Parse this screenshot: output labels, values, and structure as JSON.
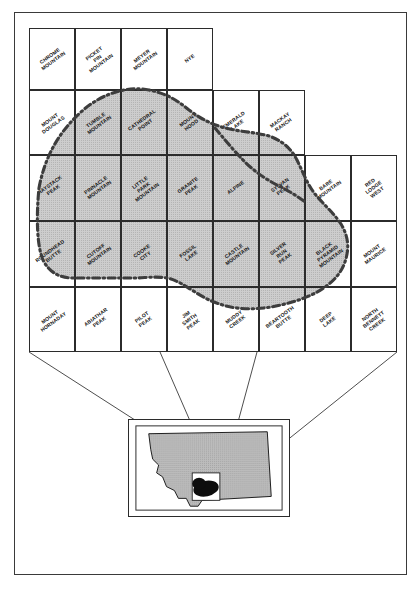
{
  "figure": {
    "kind": "index-map",
    "colors": {
      "shade_fill": "#c9c9c9",
      "boundary": "#3d3d3d",
      "line": "#2b2b2b",
      "study_area": "#101010",
      "paper": "#ffffff"
    }
  },
  "quad_grid": {
    "rows": [
      {
        "row": 1,
        "cells": [
          {
            "col": 1,
            "label": "CHROME\nMOUNTAIN"
          },
          {
            "col": 2,
            "label": "PICKET PIN\nMOUNTAIN"
          },
          {
            "col": 3,
            "label": "MEYER\nMOUNTAIN"
          },
          {
            "col": 4,
            "label": "NYE"
          }
        ]
      },
      {
        "row": 2,
        "cells": [
          {
            "col": 1,
            "label": "MOUNT\nDOUGLAS"
          },
          {
            "col": 2,
            "label": "TUMBLE\nMOUNTAIN"
          },
          {
            "col": 3,
            "label": "CATHEDRAL\nPOINT"
          },
          {
            "col": 4,
            "label": "MOUNT\nHOOD"
          },
          {
            "col": 5,
            "label": "EMERALD\nLAKE"
          },
          {
            "col": 6,
            "label": "MACKAY\nRANCH"
          }
        ]
      },
      {
        "row": 3,
        "cells": [
          {
            "col": 1,
            "label": "HAYSTACK\nPEAK"
          },
          {
            "col": 2,
            "label": "PINNACLE\nMOUNTAIN"
          },
          {
            "col": 3,
            "label": "LITTLE PARK\nMOUNTAIN"
          },
          {
            "col": 4,
            "label": "GRANITE\nPEAK"
          },
          {
            "col": 5,
            "label": "ALPINE"
          },
          {
            "col": 6,
            "label": "SYLVAN\nPEAK"
          },
          {
            "col": 7,
            "label": "BARE\nMOUNTAIN"
          },
          {
            "col": 8,
            "label": "RED LODGE\nWEST"
          }
        ]
      },
      {
        "row": 4,
        "cells": [
          {
            "col": 1,
            "label": "ROUNDHEAD\nBUTTE"
          },
          {
            "col": 2,
            "label": "CUTOFF\nMOUNTAIN"
          },
          {
            "col": 3,
            "label": "COOKE\nCITY"
          },
          {
            "col": 4,
            "label": "FOSSIL\nLAKE"
          },
          {
            "col": 5,
            "label": "CASTLE\nMOUNTAIN"
          },
          {
            "col": 6,
            "label": "SILVER RUN\nPEAK"
          },
          {
            "col": 7,
            "label": "BLACK PYRAMID\nMOUNTAIN"
          },
          {
            "col": 8,
            "label": "MOUNT\nMAURICE"
          }
        ]
      },
      {
        "row": 5,
        "cells": [
          {
            "col": 1,
            "label": "MOUNT\nHORNADAY"
          },
          {
            "col": 2,
            "label": "ABIATHAR\nPEAK"
          },
          {
            "col": 3,
            "label": "PILOT\nPEAK"
          },
          {
            "col": 4,
            "label": "JIM SMITH\nPEAK"
          },
          {
            "col": 5,
            "label": "MUDDY\nCREEK"
          },
          {
            "col": 6,
            "label": "BEARTOOTH\nBUTTE"
          },
          {
            "col": 7,
            "label": "DEEP\nLAKE"
          },
          {
            "col": 8,
            "label": "NORTH BENNETT\nCREEK"
          }
        ]
      }
    ]
  },
  "inset": {
    "state_name": "Montana",
    "state_fill": "#b9b9b9",
    "study_area_fill": "#0d0d0d",
    "detail_window_fill": "#ffffff"
  },
  "connectors": {
    "count": 4,
    "note": "leader lines from quad grid corners to inset detail window corners"
  }
}
